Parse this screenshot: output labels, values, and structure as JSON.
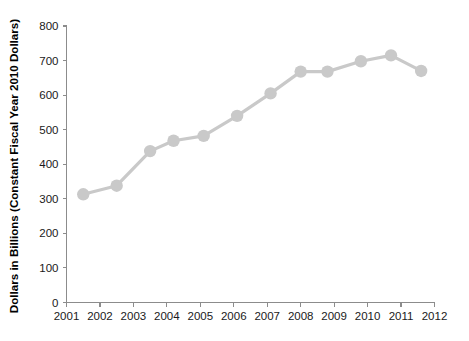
{
  "chart_data": {
    "type": "line",
    "title": "",
    "subtitle": "",
    "xlabel": "",
    "ylabel": "Dollars in Billions (Constant Fiscal Year 2010 Dollars)",
    "xlim": [
      2001,
      2012
    ],
    "ylim": [
      0,
      800
    ],
    "xticks": [
      "2001",
      "2002",
      "2003",
      "2004",
      "2005",
      "2006",
      "2007",
      "2008",
      "2009",
      "2010",
      "2011",
      "2012"
    ],
    "yticks": [
      "0",
      "100",
      "200",
      "300",
      "400",
      "500",
      "600",
      "700",
      "800"
    ],
    "grid": false,
    "legend": null,
    "legend_position": "none",
    "marker": "circle",
    "series_color": "#c9c9c9",
    "axis_color": "#8c8c8c",
    "label_color": "#1a1a1a",
    "x": [
      2001.5,
      2002.5,
      2003.5,
      2004.2,
      2005.1,
      2006.1,
      2007.1,
      2008.0,
      2008.8,
      2009.8,
      2010.7,
      2011.6
    ],
    "values": [
      313,
      338,
      438,
      468,
      482,
      540,
      605,
      668,
      668,
      698,
      715,
      670
    ],
    "series": [
      {
        "name": "Defense Spending",
        "values": [
          313,
          338,
          438,
          468,
          482,
          540,
          605,
          668,
          668,
          698,
          715,
          670
        ]
      }
    ],
    "annotations": []
  },
  "artifacts": {
    "top_bleed_text": ""
  }
}
